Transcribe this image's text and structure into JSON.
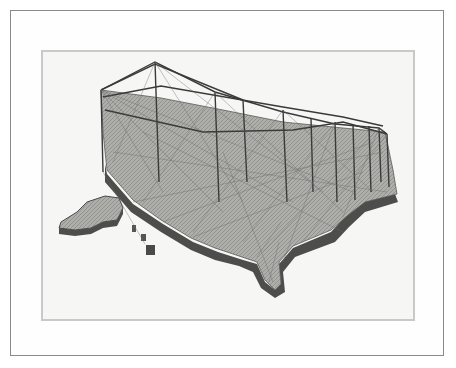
{
  "figure": {
    "regions": [
      "contiguous-us",
      "alaska",
      "hawaii"
    ],
    "legend": {
      "type": "grayscale-colorbar",
      "gradient_from": "#b8b8b8",
      "gradient_to": "#2e2e2e"
    },
    "colors": {
      "background": "#ffffff",
      "panel": "#f6f6f4",
      "land": "#a9a9a6",
      "land_edge": "#4a4a48",
      "arc": "#3c3c3c"
    }
  }
}
